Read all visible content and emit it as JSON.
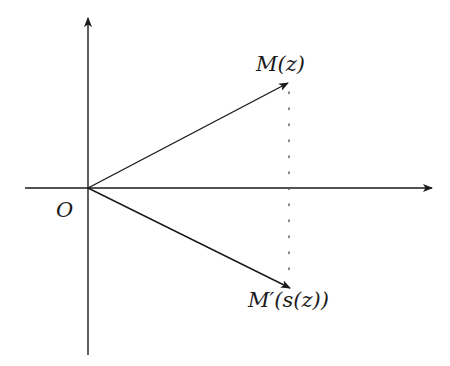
{
  "diagram": {
    "title": "",
    "origin_label": "O",
    "points": [
      {
        "id": "M",
        "label": "M(z)"
      },
      {
        "id": "M_prime",
        "label": "M′(s(z))"
      }
    ],
    "axes": {
      "horizontal": {
        "direction": "right",
        "arrow": true
      },
      "vertical": {
        "direction": "up",
        "arrow": true
      }
    },
    "vectors": [
      {
        "from": "O",
        "to": "M",
        "style": "solid-arrow"
      },
      {
        "from": "O",
        "to": "M_prime",
        "style": "solid-arrow"
      }
    ],
    "connectors": [
      {
        "from": "M",
        "to": "M_prime",
        "style": "dotted",
        "orientation": "vertical"
      }
    ],
    "colors": {
      "stroke": "#1a1a1a",
      "background": "#ffffff",
      "dotted": "#555555"
    }
  }
}
